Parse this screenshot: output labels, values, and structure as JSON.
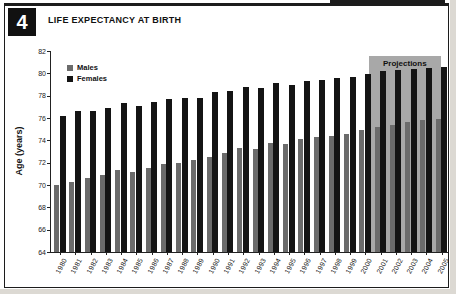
{
  "figure": {
    "number": "4",
    "title": "LIFE EXPECTANCY AT BIRTH"
  },
  "chart_data": {
    "type": "bar",
    "title": "LIFE EXPECTANCY AT BIRTH",
    "xlabel": "",
    "ylabel": "Age (years)",
    "ylim": [
      64,
      82
    ],
    "ytick_step": 2,
    "grid": false,
    "legend_position": "top-left",
    "categories": [
      "1980",
      "1981",
      "1982",
      "1983",
      "1984",
      "1985",
      "1986",
      "1987",
      "1988",
      "1989",
      "1990",
      "1991",
      "1992",
      "1993",
      "1994",
      "1995",
      "1996",
      "1997",
      "1998",
      "1999",
      "2000",
      "2001",
      "2002",
      "2003",
      "2004",
      "2005"
    ],
    "series": [
      {
        "name": "Males",
        "color": "#6b6b6b",
        "values": [
          70.0,
          70.3,
          70.6,
          70.9,
          71.3,
          71.2,
          71.5,
          71.9,
          72.0,
          72.2,
          72.5,
          72.9,
          73.3,
          73.2,
          73.8,
          73.7,
          74.1,
          74.3,
          74.4,
          74.6,
          74.9,
          75.2,
          75.4,
          75.6,
          75.8,
          75.9
        ]
      },
      {
        "name": "Females",
        "color": "#141414",
        "values": [
          76.2,
          76.6,
          76.6,
          76.9,
          77.3,
          77.1,
          77.4,
          77.7,
          77.8,
          77.8,
          78.3,
          78.4,
          78.8,
          78.7,
          79.1,
          79.0,
          79.3,
          79.4,
          79.6,
          79.7,
          79.9,
          80.2,
          80.3,
          80.4,
          80.5,
          80.6
        ]
      }
    ],
    "annotations": [
      {
        "label": "Projections",
        "start_category": "2001",
        "end_category": "2005",
        "region_color": "#a8a8a8"
      }
    ]
  },
  "colors": {
    "frame": "#1c1c1c",
    "figure_badge_bg": "#111111",
    "figure_badge_text": "#ffffff",
    "axis": "#222222",
    "projection_region": "#a8a8a8"
  }
}
